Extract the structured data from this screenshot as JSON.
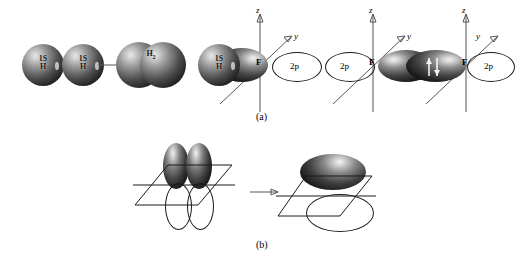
{
  "figure": {
    "panels": [
      {
        "id": "a",
        "label": "(a)",
        "steps": [
          {
            "kind": "sphere",
            "line1": "1S",
            "line2": "H"
          },
          {
            "kind": "sphere",
            "line1": "1S",
            "line2": "H"
          },
          {
            "kind": "arrow",
            "glyph": "→"
          },
          {
            "kind": "overlap-spheres",
            "molecule_label": "H",
            "molecule_sub": "2"
          }
        ],
        "orbital_diagrams": [
          {
            "id": "hf-overlap",
            "center_atom": "F",
            "axis_z": "z",
            "axis_y": "y",
            "sphere_line1": "1S",
            "sphere_line2": "H",
            "left_lobe_type": "shaded",
            "right_lobe_type": "outline",
            "right_lobe_label": "2p",
            "electron_arrows": 0
          },
          {
            "id": "f-left-outline",
            "center_atom": "F",
            "axis_z": "z",
            "axis_y": "y",
            "left_lobe_type": "outline",
            "left_lobe_label": "2p",
            "right_lobe_type": "shaded",
            "electron_arrows": 0
          },
          {
            "id": "f-paired",
            "center_atom": "F",
            "axis_z": "z",
            "axis_y": "y",
            "left_lobe_type": "shaded",
            "right_lobe_type": "outline",
            "right_lobe_label": "2p",
            "electron_arrows": 2
          }
        ]
      },
      {
        "id": "b",
        "label": "(b)",
        "left": {
          "description": "two p orbitals above and below nodal plane",
          "upper_lobes": 2,
          "lower_lobes": 2,
          "lobe_style_upper": "shaded",
          "lobe_style_lower": "outline"
        },
        "arrow": "→",
        "right": {
          "description": "merged pi orbital cloud above and below nodal plane",
          "upper_lobes": 1,
          "lower_lobes": 1,
          "lobe_style_upper": "shaded",
          "lobe_style_lower": "outline"
        }
      }
    ],
    "colors": {
      "line": "#555555",
      "outline": "#1a1a1a",
      "background": "#ffffff",
      "text": "#000000"
    }
  }
}
